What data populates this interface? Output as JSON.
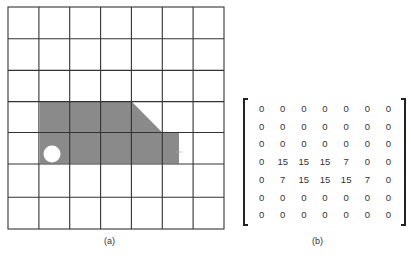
{
  "figure_a": {
    "caption": "(a)",
    "grid": {
      "rows": 7,
      "cols": 7,
      "left": 8,
      "top": 7,
      "right": 224,
      "bottom": 229
    },
    "shape_fill": "#8a8a8a",
    "hole_fill": "#ffffff"
  },
  "figure_b": {
    "caption": "(b)",
    "matrix": [
      [
        "0",
        "0",
        "0",
        "0",
        "0",
        "0",
        "0"
      ],
      [
        "0",
        "0",
        "0",
        "0",
        "0",
        "0",
        "0"
      ],
      [
        "0",
        "0",
        "0",
        "0",
        "0",
        "0",
        "0"
      ],
      [
        "0",
        "15",
        "15",
        "15",
        "7",
        "0",
        "0"
      ],
      [
        "0",
        "7",
        "15",
        "15",
        "15",
        "7",
        "0"
      ],
      [
        "0",
        "0",
        "0",
        "0",
        "0",
        "0",
        "0"
      ],
      [
        "0",
        "0",
        "0",
        "0",
        "0",
        "0",
        "0"
      ]
    ]
  }
}
